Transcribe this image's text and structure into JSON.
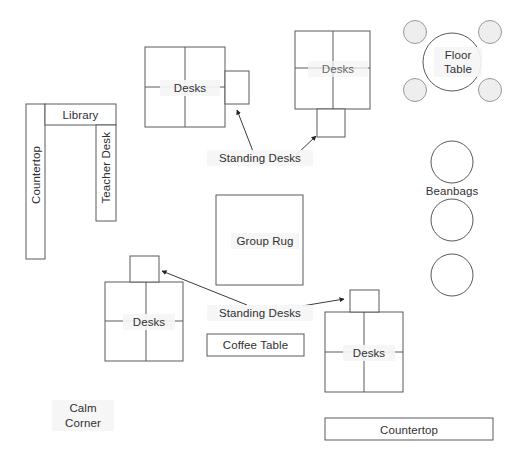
{
  "diagram": {
    "type": "floor-plan",
    "canvas": {
      "width": 517,
      "height": 461
    },
    "colors": {
      "background": "#ffffff",
      "outline": "#585a5e",
      "text": "#2f3033",
      "stool_fill": "#eeeeee",
      "label_halo": "#f5f5f5",
      "leader_line": "#3a3a3c"
    }
  },
  "zones": {
    "countertop_left": {
      "label": "Countertop",
      "orientation": "vertical"
    },
    "library": {
      "label": "Library",
      "orientation": "horizontal"
    },
    "teacher_desk": {
      "label": "Teacher Desk",
      "orientation": "vertical"
    },
    "desk_cluster_top_left": {
      "label": "Desks",
      "seats": 4,
      "standing_desk_side": "right"
    },
    "desk_cluster_top_right": {
      "label": "Desks",
      "seats": 4,
      "standing_desk_side": "bottom"
    },
    "desk_cluster_bottom_left": {
      "label": "Desks",
      "seats": 4,
      "standing_desk_side": "top"
    },
    "desk_cluster_bottom_right": {
      "label": "Desks",
      "seats": 4,
      "standing_desk_side": "top"
    },
    "floor_table": {
      "label_line1": "Floor",
      "label_line2": "Table",
      "stools": 4
    },
    "beanbags": {
      "label": "Beanbags",
      "count": 3
    },
    "group_rug": {
      "label": "Group Rug"
    },
    "coffee_table": {
      "label": "Coffee Table"
    },
    "calm_corner": {
      "label_line1": "Calm",
      "label_line2": "Corner"
    },
    "countertop_bottom": {
      "label": "Countertop",
      "orientation": "horizontal"
    }
  },
  "annotations": [
    {
      "id": "standing-desks-upper",
      "label": "Standing Desks",
      "arrow_count": 2
    },
    {
      "id": "standing-desks-lower",
      "label": "Standing Desks",
      "arrow_count": 2
    }
  ]
}
